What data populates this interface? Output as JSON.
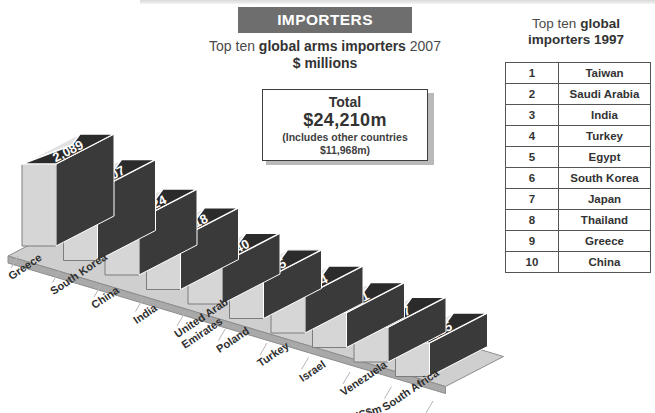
{
  "banner": {
    "title": "IMPORTERS"
  },
  "subtitle": {
    "line1_a": "Top ten ",
    "line1_b": "global arms importers",
    "line1_c": " 2007",
    "unit": "$ millions"
  },
  "total_box": {
    "label": "Total",
    "value": "$24,210m",
    "note_line1": "(Includes other countries",
    "note_line2": "$11,968m)"
  },
  "side_table": {
    "title_a": "Top ten ",
    "title_b": "global",
    "title_c": "importers 1997",
    "rows": [
      {
        "rank": "1",
        "country": "Taiwan"
      },
      {
        "rank": "2",
        "country": "Saudi Arabia"
      },
      {
        "rank": "3",
        "country": "India"
      },
      {
        "rank": "4",
        "country": "Turkey"
      },
      {
        "rank": "5",
        "country": "Egypt"
      },
      {
        "rank": "6",
        "country": "South Korea"
      },
      {
        "rank": "7",
        "country": "Japan"
      },
      {
        "rank": "8",
        "country": "Thailand"
      },
      {
        "rank": "9",
        "country": "Greece"
      },
      {
        "rank": "10",
        "country": "China"
      }
    ]
  },
  "chart_data": {
    "type": "bar",
    "title": "Top ten global arms importers 2007",
    "subtitle": "$ millions",
    "xlabel": "",
    "ylabel": "US$m",
    "axis_label": "US$m",
    "categories": [
      "Greece",
      "South Korea",
      "China",
      "India",
      "United Arab Emirates",
      "Poland",
      "Turkey",
      "Israel",
      "Venezuela",
      "South Africa"
    ],
    "values": [
      2089,
      1807,
      1424,
      1318,
      1040,
      985,
      944,
      891,
      887,
      855
    ],
    "value_labels": [
      "2,089",
      "1,807",
      "1,424",
      "1,318",
      "1,040",
      "985",
      "944",
      "891",
      "887",
      "855"
    ],
    "ylim": [
      0,
      2089
    ],
    "grid": false,
    "legend": "none",
    "total": 24210,
    "other_countries": 11968,
    "colors": {
      "bar_front": "#d6d6d6",
      "bar_top_dark": "#2b2b2b",
      "base": "#cfcfcf",
      "value_text": "#ffffff",
      "banner": "#6e6e6e"
    }
  }
}
